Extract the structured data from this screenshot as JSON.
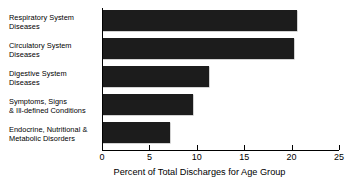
{
  "chart_data": {
    "type": "bar",
    "orientation": "horizontal",
    "title": "",
    "subtitle": "",
    "xlabel": "Percent of Total Discharges for Age Group",
    "ylabel": "",
    "xlim": [
      0,
      25
    ],
    "xticks": [
      0,
      5,
      10,
      15,
      20,
      25
    ],
    "xtick_labels": [
      "0",
      "5",
      "10",
      "15",
      "20",
      "25"
    ],
    "grid": false,
    "legend": false,
    "legend_position": "none",
    "bar_color": "#1c1c1c",
    "categories": [
      "Respiratory System Diseases",
      "Circulatory System Diseases",
      "Digestive System Diseases",
      "Symptoms, Signs & Ill-defined Conditions",
      "Endocrine, Nutritional & Metabolic Disorders"
    ],
    "category_lines": [
      [
        "Respiratory System",
        "Diseases"
      ],
      [
        "Circulatory System",
        "Diseases"
      ],
      [
        "Digestive System",
        "Diseases"
      ],
      [
        "Symptoms, Signs",
        "& Ill-defined Conditions"
      ],
      [
        "Endocrine, Nutritional &",
        "Metabolic Disorders"
      ]
    ],
    "values": [
      20.6,
      20.3,
      11.3,
      9.6,
      7.2
    ]
  }
}
